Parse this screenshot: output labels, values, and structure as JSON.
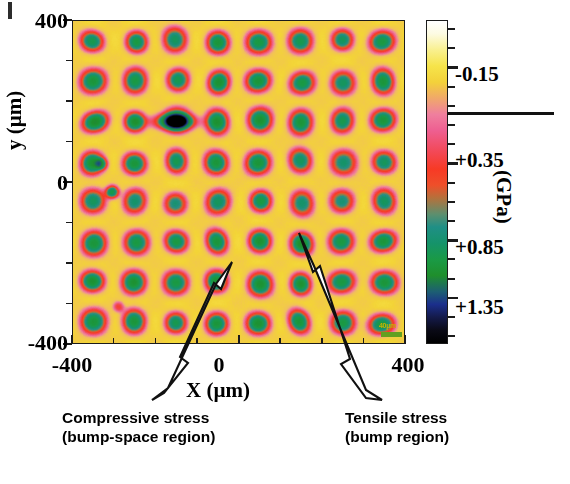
{
  "figure": {
    "kind": "stress-map-heatmap",
    "corner_artifact": "scan-artifact-mark"
  },
  "axes": {
    "x_title": "X (µm)",
    "y_title": "y (µm)",
    "x_ticklabels": [
      "-400",
      "0",
      "400"
    ],
    "y_ticklabels": [
      "400",
      "0",
      "-400"
    ],
    "x_range": [
      -400,
      400
    ],
    "y_range": [
      -400,
      400
    ],
    "x_minor_step": 100,
    "y_minor_step": 100
  },
  "colorbar": {
    "unit_label": "(GPa)",
    "ticklabels": [
      "-0.15",
      "+0.35",
      "+0.85",
      "+1.35"
    ],
    "tickvalues": [
      -0.15,
      0.35,
      0.85,
      1.35
    ],
    "vmin": -0.65,
    "vmax": 1.85,
    "reversed": true,
    "zero_reference_line": true,
    "stops": [
      {
        "pos": 0,
        "color": "#ffffff"
      },
      {
        "pos": 9,
        "color": "#f9f08f"
      },
      {
        "pos": 19,
        "color": "#f3d13a"
      },
      {
        "pos": 29,
        "color": "#ef7f9e"
      },
      {
        "pos": 40,
        "color": "#f24a5c"
      },
      {
        "pos": 46,
        "color": "#f73a25"
      },
      {
        "pos": 64,
        "color": "#1f8f86"
      },
      {
        "pos": 74,
        "color": "#1a9a46"
      },
      {
        "pos": 88,
        "color": "#1b2f8c"
      },
      {
        "pos": 100,
        "color": "#000000"
      }
    ]
  },
  "scalebar_artifact": {
    "text": "40µm",
    "bar_color": "#63a020"
  },
  "annotations": [
    {
      "id": "compressive",
      "line1": "Compressive stress",
      "line2": "(bump-space region)",
      "arrow_tip": [
        232,
        262
      ],
      "arrow_tail": [
        152,
        400
      ],
      "points_at": "bump-space region"
    },
    {
      "id": "tensile",
      "line1": "Tensile stress",
      "line2": "(bump region)",
      "arrow_tip": [
        299,
        233
      ],
      "arrow_tail": [
        382,
        400
      ],
      "points_at": "bump region"
    }
  ],
  "chart_data": {
    "type": "heatmap",
    "title": "",
    "xlabel": "X (µm)",
    "ylabel": "y (µm)",
    "xlim": [
      -400,
      400
    ],
    "ylim": [
      -400,
      400
    ],
    "clim": [
      -0.65,
      1.85
    ],
    "cbar_label": "(GPa)",
    "cbar_ticks": [
      -0.15,
      0.35,
      0.85,
      1.35
    ],
    "grid": false,
    "legend": "none",
    "lattice": {
      "nx": 8,
      "ny": 8,
      "period_um": 100,
      "first_center_um": [
        -350,
        350
      ],
      "bump_core_radius_um": 9,
      "bump_ring_radius_um": 22,
      "bump_halo_radius_um": 34
    },
    "values": {
      "background_bump_space": -0.15,
      "halo": 0.1,
      "ring": 0.45,
      "core": 1.1,
      "core_peak": 1.35
    },
    "series": [
      {
        "name": "row y=+350",
        "x": [
          -350,
          -250,
          -150,
          -50,
          50,
          150,
          250,
          350
        ],
        "values": [
          1.05,
          1.1,
          1.0,
          1.15,
          1.1,
          1.05,
          1.0,
          1.1
        ]
      },
      {
        "name": "row y=+250",
        "x": [
          -350,
          -250,
          -150,
          -50,
          50,
          150,
          250,
          350
        ],
        "values": [
          1.15,
          1.1,
          1.05,
          1.2,
          1.15,
          1.1,
          1.0,
          1.15
        ]
      },
      {
        "name": "row y=+150",
        "x": [
          -350,
          -250,
          -150,
          -50,
          50,
          150,
          250,
          350
        ],
        "values": [
          1.25,
          1.2,
          1.1,
          1.2,
          1.2,
          1.15,
          1.05,
          1.15
        ]
      },
      {
        "name": "row y=+50",
        "x": [
          -350,
          -250,
          -150,
          -50,
          50,
          150,
          250,
          350
        ],
        "values": [
          1.2,
          1.15,
          1.05,
          1.15,
          1.15,
          1.0,
          0.95,
          1.0
        ]
      },
      {
        "name": "row y=-50",
        "x": [
          -350,
          -250,
          -150,
          -50,
          50,
          150,
          250,
          350
        ],
        "values": [
          1.0,
          0.95,
          0.9,
          1.0,
          1.1,
          0.95,
          0.9,
          1.0
        ]
      },
      {
        "name": "row y=-150",
        "x": [
          -350,
          -250,
          -150,
          -50,
          50,
          150,
          250,
          350
        ],
        "values": [
          1.15,
          1.1,
          1.1,
          1.15,
          1.2,
          1.25,
          1.1,
          1.15
        ]
      },
      {
        "name": "row y=-250",
        "x": [
          -350,
          -250,
          -150,
          -50,
          50,
          150,
          250,
          350
        ],
        "values": [
          1.2,
          1.2,
          1.1,
          1.2,
          1.2,
          1.2,
          1.1,
          1.15
        ]
      },
      {
        "name": "row y=-350",
        "x": [
          -350,
          -250,
          -150,
          -50,
          50,
          150,
          250,
          350
        ],
        "values": [
          1.15,
          1.15,
          1.05,
          1.15,
          1.2,
          1.15,
          1.1,
          1.1
        ]
      }
    ]
  }
}
